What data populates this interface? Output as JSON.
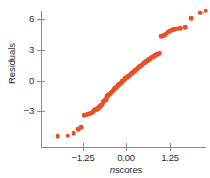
{
  "figure": {
    "width": 210,
    "height": 178,
    "background": "#ffffff",
    "point_color": "#e8502a",
    "axis_color": "#8b8b8b",
    "text_color": "#2b2b2b"
  },
  "axes": {
    "xlabel_prefix": "n",
    "xlabel_rest": "scores",
    "xlabel_full": "nscores",
    "ylabel": "Residuals",
    "x_ticks": [
      {
        "label": "−1.25",
        "value": -1.25,
        "px": 83
      },
      {
        "label": "0.00",
        "value": 0.0,
        "px": 126
      },
      {
        "label": "1.25",
        "value": 1.25,
        "px": 170
      }
    ],
    "y_ticks": [
      {
        "label": "6",
        "value": 6,
        "px": 19
      },
      {
        "label": "3",
        "value": 3,
        "px": 50
      },
      {
        "label": "0",
        "value": 0,
        "px": 81
      },
      {
        "label": "−3",
        "value": -3,
        "px": 111
      }
    ],
    "xlim": [
      -2.05,
      2.3
    ],
    "ylim": [
      -7.0,
      7.2
    ],
    "grid": false
  },
  "chart_data": {
    "type": "scatter",
    "title": "",
    "xlabel": "nscores",
    "ylabel": "Residuals",
    "xlim": [
      -2.05,
      2.3
    ],
    "ylim": [
      -7.0,
      7.2
    ],
    "grid": false,
    "legend": null,
    "series_name": "residuals vs normal scores",
    "marker": "filled-circle",
    "marker_color": "#e8502a",
    "x": [
      -1.98,
      -1.69,
      -1.52,
      -1.38,
      -1.3,
      -1.22,
      -1.16,
      -1.12,
      -1.07,
      -1.03,
      -0.99,
      -0.95,
      -0.92,
      -0.88,
      -0.85,
      -0.82,
      -0.79,
      -0.76,
      -0.73,
      -0.7,
      -0.67,
      -0.65,
      -0.62,
      -0.59,
      -0.57,
      -0.54,
      -0.52,
      -0.49,
      -0.47,
      -0.44,
      -0.42,
      -0.39,
      -0.37,
      -0.35,
      -0.32,
      -0.3,
      -0.28,
      -0.25,
      -0.23,
      -0.21,
      -0.18,
      -0.16,
      -0.14,
      -0.12,
      -0.09,
      -0.07,
      -0.05,
      -0.03,
      0.0,
      0.02,
      0.05,
      0.07,
      0.09,
      0.12,
      0.14,
      0.16,
      0.18,
      0.21,
      0.23,
      0.25,
      0.28,
      0.3,
      0.32,
      0.35,
      0.37,
      0.39,
      0.42,
      0.44,
      0.47,
      0.49,
      0.52,
      0.54,
      0.57,
      0.59,
      0.62,
      0.65,
      0.67,
      0.7,
      0.73,
      0.76,
      0.79,
      0.82,
      0.85,
      0.88,
      0.92,
      0.95,
      1.0,
      1.04,
      1.09,
      1.13,
      1.18,
      1.24,
      1.3,
      1.37,
      1.45,
      1.55,
      1.68,
      1.86,
      2.12,
      2.28
    ],
    "y": [
      -5.45,
      -5.4,
      -5.15,
      -4.8,
      -4.6,
      -3.4,
      -3.35,
      -3.3,
      -3.25,
      -3.2,
      -3.15,
      -3.05,
      -2.95,
      -2.85,
      -2.8,
      -2.7,
      -2.6,
      -2.55,
      -2.45,
      -2.4,
      -2.1,
      -2.05,
      -1.95,
      -1.85,
      -1.55,
      -1.5,
      -1.45,
      -1.4,
      -1.3,
      -1.2,
      -1.1,
      -1.0,
      -0.92,
      -0.85,
      -0.78,
      -0.7,
      -0.62,
      -0.55,
      -0.48,
      -0.4,
      -0.32,
      -0.25,
      -0.18,
      -0.1,
      -0.02,
      0.05,
      0.12,
      0.18,
      0.25,
      0.32,
      0.38,
      0.45,
      0.52,
      0.58,
      0.65,
      0.72,
      0.78,
      0.85,
      0.92,
      0.98,
      1.05,
      1.12,
      1.18,
      1.25,
      1.32,
      1.38,
      1.45,
      1.52,
      1.58,
      1.65,
      1.72,
      1.78,
      1.85,
      1.92,
      1.98,
      2.05,
      2.12,
      2.18,
      2.25,
      2.32,
      2.38,
      2.45,
      2.52,
      2.58,
      2.62,
      2.65,
      4.3,
      4.35,
      4.42,
      4.5,
      4.7,
      4.8,
      4.9,
      5.0,
      5.05,
      5.1,
      5.2,
      6.1,
      6.6,
      6.8
    ]
  }
}
